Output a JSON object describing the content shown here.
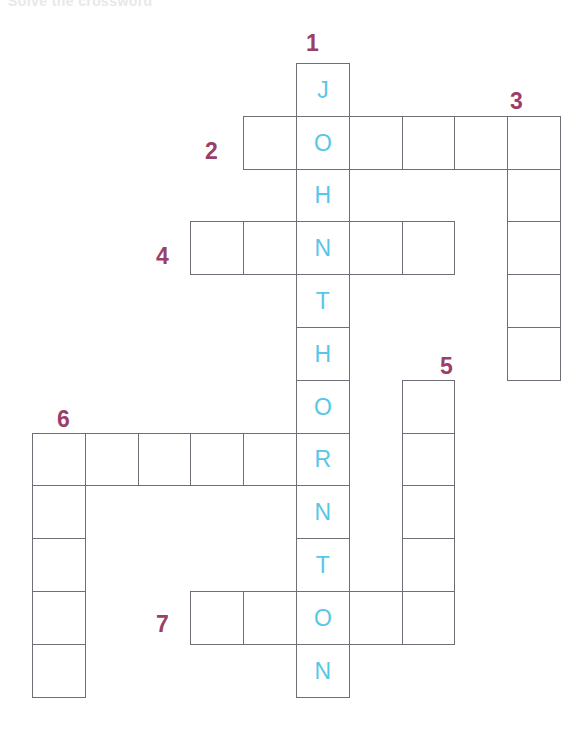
{
  "page": {
    "header_sliver_text": "Solve the crossword",
    "background_color": "#ffffff"
  },
  "palette": {
    "cell_border": "#6e6e77",
    "cell_fill": "#ffffff",
    "letter_color": "#57c6e8",
    "number_color": "#9b3f68"
  },
  "geometry": {
    "cell_size": 52.8,
    "origin_x": 32,
    "origin_y": 63,
    "columns": 10,
    "rows": 12
  },
  "solution_word": "JOHNTHORNTON",
  "entries": [
    {
      "number": "1",
      "direction": "down",
      "length": 12,
      "start_col": 5,
      "start_row": 0,
      "number_x": 306,
      "number_y": 32,
      "letters": [
        "J",
        "O",
        "H",
        "N",
        "T",
        "H",
        "O",
        "R",
        "N",
        "T",
        "O",
        "N"
      ]
    },
    {
      "number": "2",
      "direction": "across",
      "length": 6,
      "start_col": 4,
      "start_row": 1,
      "number_x": 205,
      "number_y": 140,
      "letters": [
        "",
        "O",
        "",
        "",
        "",
        ""
      ]
    },
    {
      "number": "3",
      "direction": "down",
      "length": 5,
      "start_col": 9,
      "start_row": 1,
      "number_x": 510,
      "number_y": 90,
      "letters": [
        "",
        "",
        "",
        "",
        ""
      ]
    },
    {
      "number": "4",
      "direction": "across",
      "length": 5,
      "start_col": 3,
      "start_row": 3,
      "number_x": 156,
      "number_y": 245,
      "letters": [
        "",
        "",
        "N",
        "",
        ""
      ]
    },
    {
      "number": "5",
      "direction": "down",
      "length": 5,
      "start_col": 7,
      "start_row": 6,
      "number_x": 440,
      "number_y": 355,
      "letters": [
        "",
        "",
        "",
        "",
        ""
      ]
    },
    {
      "number": "6",
      "direction": "across",
      "length": 6,
      "start_col": 0,
      "start_row": 7,
      "number_x": 57,
      "number_y": 408,
      "letters": [
        "",
        "",
        "",
        "",
        "",
        "R"
      ]
    },
    {
      "number": "6v",
      "direction": "down",
      "length": 5,
      "start_col": 0,
      "start_row": 7,
      "number_x": null,
      "number_y": null,
      "letters": [
        "",
        "",
        "",
        "",
        ""
      ]
    },
    {
      "number": "7",
      "direction": "across",
      "length": 5,
      "start_col": 3,
      "start_row": 10,
      "number_x": 156,
      "number_y": 613,
      "letters": [
        "",
        "",
        "O",
        "",
        ""
      ]
    }
  ],
  "cells": [
    {
      "col": 5,
      "row": 0,
      "letter": "J"
    },
    {
      "col": 4,
      "row": 1,
      "letter": ""
    },
    {
      "col": 5,
      "row": 1,
      "letter": "O"
    },
    {
      "col": 6,
      "row": 1,
      "letter": ""
    },
    {
      "col": 7,
      "row": 1,
      "letter": ""
    },
    {
      "col": 8,
      "row": 1,
      "letter": ""
    },
    {
      "col": 9,
      "row": 1,
      "letter": ""
    },
    {
      "col": 5,
      "row": 2,
      "letter": "H"
    },
    {
      "col": 9,
      "row": 2,
      "letter": ""
    },
    {
      "col": 3,
      "row": 3,
      "letter": ""
    },
    {
      "col": 4,
      "row": 3,
      "letter": ""
    },
    {
      "col": 5,
      "row": 3,
      "letter": "N"
    },
    {
      "col": 6,
      "row": 3,
      "letter": ""
    },
    {
      "col": 7,
      "row": 3,
      "letter": ""
    },
    {
      "col": 9,
      "row": 3,
      "letter": ""
    },
    {
      "col": 5,
      "row": 4,
      "letter": "T"
    },
    {
      "col": 9,
      "row": 4,
      "letter": ""
    },
    {
      "col": 5,
      "row": 5,
      "letter": "H"
    },
    {
      "col": 9,
      "row": 5,
      "letter": ""
    },
    {
      "col": 5,
      "row": 6,
      "letter": "O"
    },
    {
      "col": 7,
      "row": 6,
      "letter": ""
    },
    {
      "col": 0,
      "row": 7,
      "letter": ""
    },
    {
      "col": 1,
      "row": 7,
      "letter": ""
    },
    {
      "col": 2,
      "row": 7,
      "letter": ""
    },
    {
      "col": 3,
      "row": 7,
      "letter": ""
    },
    {
      "col": 4,
      "row": 7,
      "letter": ""
    },
    {
      "col": 5,
      "row": 7,
      "letter": "R"
    },
    {
      "col": 7,
      "row": 7,
      "letter": ""
    },
    {
      "col": 0,
      "row": 8,
      "letter": ""
    },
    {
      "col": 5,
      "row": 8,
      "letter": "N"
    },
    {
      "col": 7,
      "row": 8,
      "letter": ""
    },
    {
      "col": 0,
      "row": 9,
      "letter": ""
    },
    {
      "col": 5,
      "row": 9,
      "letter": "T"
    },
    {
      "col": 7,
      "row": 9,
      "letter": ""
    },
    {
      "col": 0,
      "row": 10,
      "letter": ""
    },
    {
      "col": 3,
      "row": 10,
      "letter": ""
    },
    {
      "col": 4,
      "row": 10,
      "letter": ""
    },
    {
      "col": 5,
      "row": 10,
      "letter": "O"
    },
    {
      "col": 6,
      "row": 10,
      "letter": ""
    },
    {
      "col": 7,
      "row": 10,
      "letter": ""
    },
    {
      "col": 0,
      "row": 11,
      "letter": ""
    },
    {
      "col": 5,
      "row": 11,
      "letter": "N"
    }
  ],
  "visible_numbers": [
    {
      "label": "1",
      "x": 306,
      "y": 32,
      "name": "clue-number-1"
    },
    {
      "label": "2",
      "x": 205,
      "y": 140,
      "name": "clue-number-2"
    },
    {
      "label": "3",
      "x": 510,
      "y": 90,
      "name": "clue-number-3"
    },
    {
      "label": "4",
      "x": 156,
      "y": 245,
      "name": "clue-number-4"
    },
    {
      "label": "5",
      "x": 440,
      "y": 355,
      "name": "clue-number-5"
    },
    {
      "label": "6",
      "x": 57,
      "y": 408,
      "name": "clue-number-6"
    },
    {
      "label": "7",
      "x": 156,
      "y": 613,
      "name": "clue-number-7"
    }
  ]
}
